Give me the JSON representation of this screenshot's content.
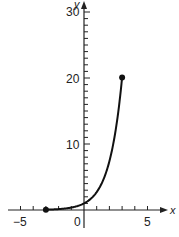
{
  "chart_data": {
    "type": "line",
    "title": "",
    "xlabel": "x",
    "ylabel": "y",
    "xlim": [
      -5,
      5
    ],
    "ylim": [
      0,
      30
    ],
    "x_tick_labels": [
      "-5",
      "0",
      "5"
    ],
    "y_tick_labels": [
      "10",
      "20",
      "30"
    ],
    "x_minor_tick_step": 1,
    "y_minor_tick_step": 1,
    "function": "y = e^x",
    "domain": [
      -3,
      3
    ],
    "endpoints": [
      {
        "x": -3,
        "y": 0.05,
        "filled": true
      },
      {
        "x": 3,
        "y": 20.09,
        "filled": true
      }
    ],
    "series": [
      {
        "name": "e^x",
        "x": [
          -3,
          -2.5,
          -2,
          -1.5,
          -1,
          -0.5,
          0,
          0.5,
          1,
          1.5,
          2,
          2.5,
          3
        ],
        "values": [
          0.05,
          0.08,
          0.14,
          0.22,
          0.37,
          0.61,
          1,
          1.65,
          2.72,
          4.48,
          7.39,
          12.18,
          20.09
        ]
      }
    ],
    "grid": false,
    "legend": null
  },
  "axes": {
    "x_label": "x",
    "y_label": "y",
    "x_ticks": {
      "neg5": "−5",
      "zero": "0",
      "pos5": "5"
    },
    "y_ticks": {
      "t10": "10",
      "t20": "20",
      "t30": "30"
    }
  }
}
